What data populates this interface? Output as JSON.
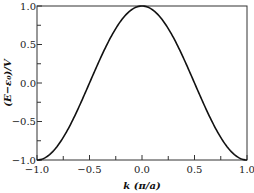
{
  "chart_data": {
    "type": "line",
    "title": "",
    "xlabel": "k (π/a)",
    "ylabel": "(E−ε₀)/V",
    "xlim": [
      -1.0,
      1.0
    ],
    "ylim": [
      -1.0,
      1.0
    ],
    "grid": false,
    "legend": null,
    "x_ticks": [
      "−1.0",
      "−0.5",
      "0.0",
      "0.5",
      "1.0"
    ],
    "y_ticks": [
      "1.0",
      "0.5",
      "0.0",
      "−0.5",
      "−1.0"
    ],
    "series": [
      {
        "name": "cos(πk)",
        "x": [
          -1.0,
          -0.9,
          -0.8,
          -0.7,
          -0.6,
          -0.5,
          -0.4,
          -0.3,
          -0.2,
          -0.1,
          0.0,
          0.1,
          0.2,
          0.3,
          0.4,
          0.5,
          0.6,
          0.7,
          0.8,
          0.9,
          1.0
        ],
        "values": [
          -1.0,
          -0.951,
          -0.809,
          -0.588,
          -0.309,
          0.0,
          0.309,
          0.588,
          0.809,
          0.951,
          1.0,
          0.951,
          0.809,
          0.588,
          0.309,
          0.0,
          -0.309,
          -0.588,
          -0.809,
          -0.951,
          -1.0
        ]
      }
    ]
  },
  "labels": {
    "xlabel_k": "k",
    "xlabel_unit": " (π/a)",
    "ylabel": "(E−ε₀)/V"
  }
}
